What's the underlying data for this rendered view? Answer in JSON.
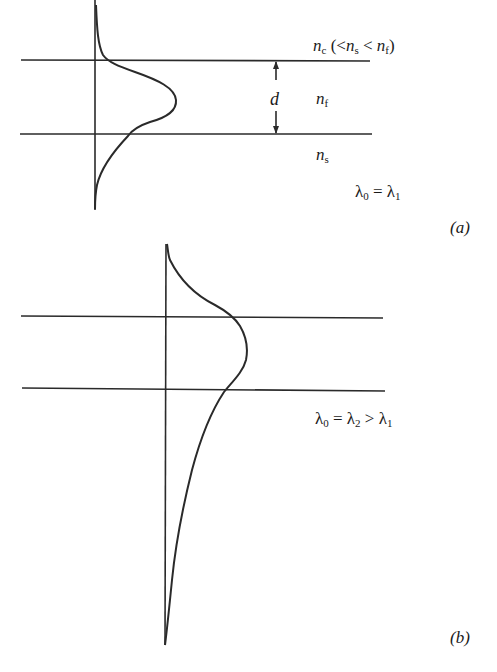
{
  "figure": {
    "panel_a": {
      "caption": "(a)",
      "layers": {
        "cover": {
          "symbol": "n",
          "sub": "c",
          "relation": "(<",
          "rel_s_sym": "n",
          "rel_s_sub": "s",
          "rel_lt": "<",
          "rel_f_sym": "n",
          "rel_f_sub": "f",
          "close": ")"
        },
        "film": {
          "symbol": "n",
          "sub": "f"
        },
        "substrate": {
          "symbol": "n",
          "sub": "s"
        }
      },
      "thickness_label": "d",
      "wavelength": {
        "lhs": "λ",
        "lhs_sub": "0",
        "eq": "=",
        "rhs": "λ",
        "rhs_sub": "1"
      }
    },
    "panel_b": {
      "caption": "(b)",
      "wavelength": {
        "lhs": "λ",
        "lhs_sub": "0",
        "eq": "=",
        "mid": "λ",
        "mid_sub": "2",
        "gt": ">",
        "rhs": "λ",
        "rhs_sub": "1"
      }
    },
    "colors": {
      "line": "#2a2a2a",
      "background": "#ffffff"
    }
  }
}
